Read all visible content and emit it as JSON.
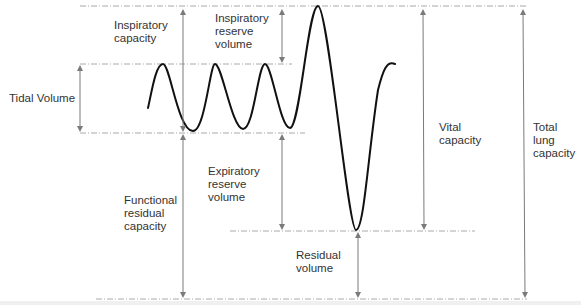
{
  "diagram": {
    "type": "lung-volumes-spirogram",
    "colors": {
      "trace": "#111111",
      "arrow": "#7a7a7a",
      "guide_line": "#9a9a9a",
      "text": "#333333"
    },
    "labels": {
      "tidal_volume": "Tidal Volume",
      "inspiratory_capacity": "Inspiratory\ncapacity",
      "inspiratory_reserve_volume": "Inspiratory\nreserve\nvolume",
      "expiratory_reserve_volume": "Expiratory\nreserve\nvolume",
      "functional_residual_capacity": "Functional\nresidual\ncapacity",
      "residual_volume": "Residual\nvolume",
      "vital_capacity": "Vital\ncapacity",
      "total_lung_capacity": "Total\nlung\ncapacity"
    }
  }
}
